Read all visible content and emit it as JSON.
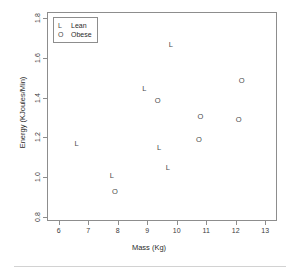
{
  "chart_data": {
    "type": "scatter",
    "title": "",
    "xlabel": "Mass (Kg)",
    "ylabel": "Energy (KJoules/Min)",
    "xlim": [
      5.6,
      13.4
    ],
    "ylim": [
      0.78,
      1.83
    ],
    "xticks": [
      "6",
      "7",
      "8",
      "9",
      "10",
      "11",
      "12",
      "13"
    ],
    "xtick_values": [
      6,
      7,
      8,
      9,
      10,
      11,
      12,
      13
    ],
    "yticks": [
      "0.8",
      "1.0",
      "1.2",
      "1.4",
      "1.6",
      "1.8"
    ],
    "ytick_values": [
      0.8,
      1.0,
      1.2,
      1.4,
      1.6,
      1.8
    ],
    "grid": false,
    "legend_position": "top-left",
    "series": [
      {
        "name": "Lean",
        "marker": "L",
        "points": [
          {
            "x": 6.6,
            "y": 1.17
          },
          {
            "x": 7.8,
            "y": 1.01
          },
          {
            "x": 8.9,
            "y": 1.45
          },
          {
            "x": 9.4,
            "y": 1.15
          },
          {
            "x": 9.7,
            "y": 1.05
          },
          {
            "x": 9.8,
            "y": 1.67
          }
        ]
      },
      {
        "name": "Obese",
        "marker": "O",
        "points": [
          {
            "x": 7.9,
            "y": 0.93
          },
          {
            "x": 9.35,
            "y": 1.39
          },
          {
            "x": 10.75,
            "y": 1.19
          },
          {
            "x": 10.8,
            "y": 1.31
          },
          {
            "x": 12.1,
            "y": 1.29
          },
          {
            "x": 12.2,
            "y": 1.49
          }
        ]
      }
    ]
  },
  "legend": {
    "entries": [
      {
        "symbol": "L",
        "label": "Lean"
      },
      {
        "symbol": "O",
        "label": "Obese"
      }
    ]
  },
  "axes": {
    "x_title": "Mass (Kg)",
    "y_title": "Energy (KJoules/Min)"
  },
  "colors": {
    "frame": "#8d8d8d",
    "point": "#4a4a4a",
    "text": "#2b2b2b",
    "background": "#ffffff",
    "rule": "#d2d2d2"
  }
}
